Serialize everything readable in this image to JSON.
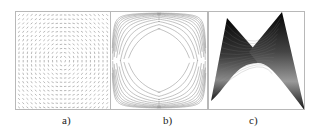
{
  "figure": {
    "panels": [
      {
        "id": "a",
        "label": "a)",
        "description": "vector field (vortex-like arrows)"
      },
      {
        "id": "b",
        "label": "b)",
        "description": "hyperbolic contour lines (saddle level sets)"
      },
      {
        "id": "c",
        "label": "c)",
        "description": "shaded saddle surface"
      }
    ]
  },
  "colors": {
    "frame": "#b8b8b8",
    "arrows": "#8a8a8a",
    "contours": "#9a9a9a",
    "surface_dark": "#0a0a0a",
    "surface_light": "#9a9a9a"
  }
}
